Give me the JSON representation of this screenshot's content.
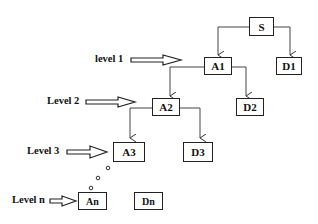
{
  "diagram": {
    "nodes": {
      "s": {
        "label": "S"
      },
      "a1": {
        "label": "A1"
      },
      "d1": {
        "label": "D1"
      },
      "a2": {
        "label": "A2"
      },
      "d2": {
        "label": "D2"
      },
      "a3": {
        "label": "A3"
      },
      "d3": {
        "label": "D3"
      },
      "an": {
        "label": "An"
      },
      "dn": {
        "label": "Dn"
      }
    },
    "levels": [
      {
        "label": "level 1",
        "points_to": "A1"
      },
      {
        "label": "Level 2",
        "points_to": "A2"
      },
      {
        "label": "Level 3",
        "points_to": "A3"
      },
      {
        "label": "Level n",
        "points_to": "An"
      }
    ],
    "edges": [
      [
        "S",
        "A1"
      ],
      [
        "S",
        "D1"
      ],
      [
        "A1",
        "A2"
      ],
      [
        "A1",
        "D2"
      ],
      [
        "A2",
        "A3"
      ],
      [
        "A2",
        "D3"
      ]
    ],
    "continuation": "ellipsis-dots between A3 and An"
  }
}
